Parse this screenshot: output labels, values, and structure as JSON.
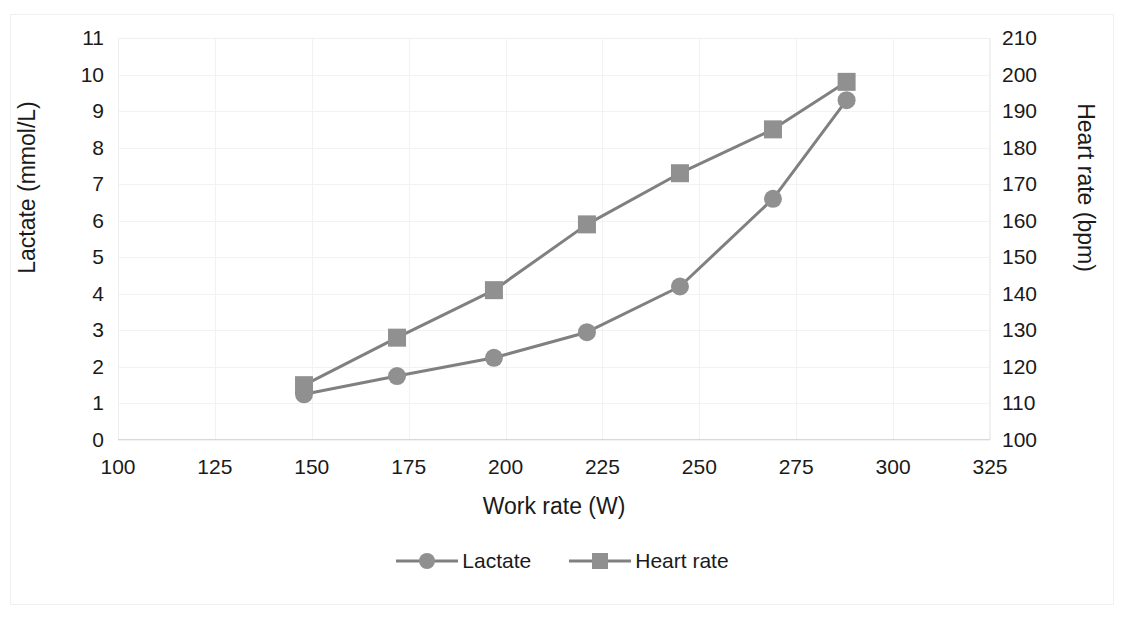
{
  "figure": {
    "clipped_header_text": "",
    "background": "#ffffff",
    "series_color": "#808080",
    "grid_color": "#f2f2f2"
  },
  "chart_data": {
    "type": "line",
    "title": "",
    "xlabel": "Work rate (W)",
    "ylabel": "Lactate (mmol/L)",
    "y2label": "Heart rate (bpm)",
    "x": [
      148,
      172,
      197,
      221,
      245,
      269,
      288
    ],
    "xlim": [
      100,
      325
    ],
    "ylim": [
      0,
      11
    ],
    "y2lim": [
      100,
      210
    ],
    "xticks": [
      "100",
      "125",
      "150",
      "175",
      "200",
      "225",
      "250",
      "275",
      "300",
      "325"
    ],
    "yticks": [
      "0",
      "1",
      "2",
      "3",
      "4",
      "5",
      "6",
      "7",
      "8",
      "9",
      "10",
      "11"
    ],
    "y2ticks": [
      "100",
      "110",
      "120",
      "130",
      "140",
      "150",
      "160",
      "170",
      "180",
      "190",
      "200",
      "210"
    ],
    "grid": true,
    "legend_position": "bottom",
    "series": [
      {
        "name": "Lactate",
        "axis": "left",
        "marker": "circle",
        "color": "#808080",
        "values": [
          1.25,
          1.75,
          2.25,
          2.95,
          4.2,
          6.6,
          9.3
        ]
      },
      {
        "name": "Heart rate",
        "axis": "right",
        "marker": "square",
        "color": "#808080",
        "values": [
          115,
          128,
          141,
          159,
          173,
          185,
          198
        ]
      }
    ]
  },
  "legend": {
    "items": [
      {
        "label": "Lactate",
        "marker": "circle-marker-icon"
      },
      {
        "label": "Heart rate",
        "marker": "square-marker-icon"
      }
    ]
  }
}
